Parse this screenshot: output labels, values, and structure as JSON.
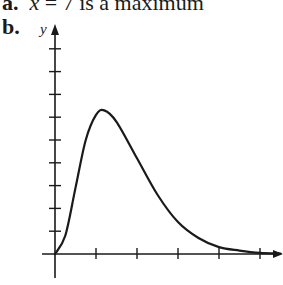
{
  "part_a": {
    "label": "a.",
    "var": "x",
    "text": " = 7 is a maximum"
  },
  "part_b": {
    "label": "b."
  },
  "chart_data": {
    "type": "line",
    "title": "",
    "xlabel": "x",
    "ylabel": "y",
    "x_ticks_count": 5,
    "y_ticks_count": 9,
    "grid": false,
    "legend": "none",
    "series": [
      {
        "name": "curve",
        "x": [
          0,
          0.25,
          0.5,
          0.75,
          1.0,
          1.2,
          1.5,
          2.0,
          2.5,
          3.0,
          3.5,
          4.0,
          4.5,
          5.0,
          5.5
        ],
        "y": [
          0,
          0.8,
          2.9,
          5.0,
          6.1,
          6.3,
          5.8,
          4.2,
          2.6,
          1.4,
          0.7,
          0.3,
          0.15,
          0.05,
          0.02
        ]
      }
    ],
    "xlim": [
      0,
      5.6
    ],
    "ylim": [
      0,
      9.2
    ]
  }
}
